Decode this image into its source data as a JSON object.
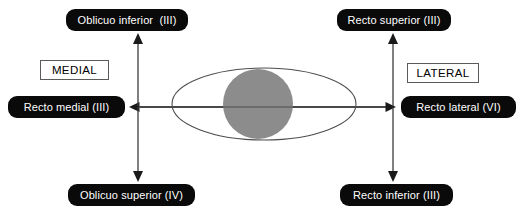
{
  "diagram": {
    "orientation_labels": [
      {
        "id": "medial",
        "text": "MEDIAL"
      },
      {
        "id": "lateral",
        "text": "LATERAL"
      }
    ],
    "muscle_labels": [
      {
        "id": "oblicuo-inferior",
        "text": "Oblicuo inferior  (III)",
        "muscle": "Oblicuo inferior",
        "nerve": "III",
        "position": "top-left"
      },
      {
        "id": "recto-superior",
        "text": "Recto superior (III)",
        "muscle": "Recto superior",
        "nerve": "III",
        "position": "top-right"
      },
      {
        "id": "recto-medial",
        "text": "Recto medial (III)",
        "muscle": "Recto medial",
        "nerve": "III",
        "position": "middle-left"
      },
      {
        "id": "recto-lateral",
        "text": "Recto lateral (VI)",
        "muscle": "Recto lateral",
        "nerve": "VI",
        "position": "middle-right"
      },
      {
        "id": "oblicuo-superior",
        "text": "Oblicuo superior (IV)",
        "muscle": "Oblicuo superior",
        "nerve": "IV",
        "position": "bottom-left"
      },
      {
        "id": "recto-inferior",
        "text": "Recto inferior (III)",
        "muscle": "Recto inferior",
        "nerve": "III",
        "position": "bottom-right"
      }
    ],
    "eye": {
      "sclera_shape": "ellipse",
      "iris_shape": "circle",
      "iris_color": "#8c8c8c",
      "outline_color": "#4d4d4d"
    },
    "colors": {
      "label_background": "#0a0a0a",
      "label_text": "#ffffff",
      "box_border": "#5a5a5a",
      "arrow": "#3c3c3c",
      "page_background": "#ffffff"
    },
    "arrows": [
      {
        "id": "arrow-up-left",
        "direction": "up",
        "points_to": "oblicuo-inferior"
      },
      {
        "id": "arrow-up-right",
        "direction": "up",
        "points_to": "recto-superior"
      },
      {
        "id": "arrow-down-left",
        "direction": "down",
        "points_to": "oblicuo-superior"
      },
      {
        "id": "arrow-down-right",
        "direction": "down",
        "points_to": "recto-inferior"
      },
      {
        "id": "arrow-left",
        "direction": "left",
        "points_to": "recto-medial"
      },
      {
        "id": "arrow-right",
        "direction": "right",
        "points_to": "recto-lateral"
      }
    ]
  }
}
